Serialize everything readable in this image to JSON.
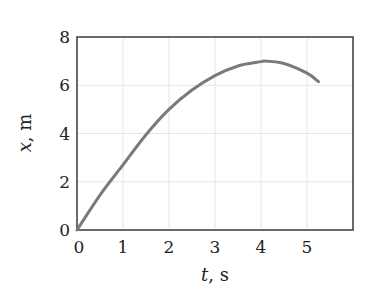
{
  "chart_data": {
    "type": "line",
    "title": "",
    "xlabel_var": "t",
    "xlabel_unit": ", s",
    "ylabel_var": "x",
    "ylabel_unit": ", m",
    "xlim": [
      0,
      6
    ],
    "ylim": [
      0,
      8
    ],
    "x_ticks": [
      0,
      1,
      2,
      3,
      4,
      5
    ],
    "y_ticks": [
      0,
      2,
      4,
      6,
      8
    ],
    "grid": true,
    "legend": null,
    "series": [
      {
        "name": "x(t)",
        "color": "#7a7a7a",
        "x": [
          0,
          0.5,
          1,
          1.5,
          2,
          2.5,
          3,
          3.5,
          4,
          4.1,
          4.5,
          5,
          5.25
        ],
        "y": [
          0,
          1.45,
          2.7,
          3.95,
          5.0,
          5.8,
          6.4,
          6.8,
          6.98,
          7.0,
          6.9,
          6.5,
          6.15
        ]
      }
    ]
  },
  "colors": {
    "frame": "#3a3a3a",
    "grid": "#e6e6e6",
    "curve": "#7a7a7a",
    "text": "#222222"
  }
}
